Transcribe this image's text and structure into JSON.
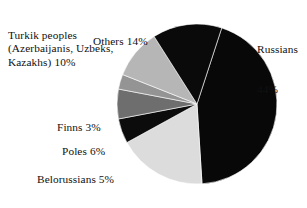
{
  "chart_data": {
    "type": "pie",
    "title": "",
    "subtitle": "",
    "xlabel": "",
    "ylabel": "",
    "legend_position": "none",
    "grid": false,
    "units": "percent",
    "total": 100,
    "categories": [
      "Russians",
      "Ukranians",
      "Belorussians",
      "Poles",
      "Finns",
      "Turkik peoples (Azerbaijanis, Uzbeks, Kazakhs)",
      "Others"
    ],
    "values": [
      44,
      18,
      5,
      6,
      3,
      10,
      14
    ],
    "slices": [
      {
        "name": "Russians",
        "value": 44,
        "value_text": "44%",
        "label_lines": [
          "Russians",
          "44%"
        ],
        "color": "#080808",
        "start_angle": -72.0,
        "end_angle": 86.4
      },
      {
        "name": "Ukranians",
        "value": 18,
        "value_text": "18%",
        "label_lines": [
          "Ukranians 18%"
        ],
        "color": "#dcdcdc",
        "start_angle": 86.4,
        "end_angle": 151.2
      },
      {
        "name": "Belorussians",
        "value": 5,
        "value_text": "5%",
        "label_lines": [
          "Belorussians 5%"
        ],
        "color": "#0c0c0c",
        "start_angle": 151.2,
        "end_angle": 169.2
      },
      {
        "name": "Poles",
        "value": 6,
        "value_text": "6%",
        "label_lines": [
          "Poles 6%"
        ],
        "color": "#6e6e6e",
        "start_angle": 169.2,
        "end_angle": 190.8
      },
      {
        "name": "Finns",
        "value": 3,
        "value_text": "3%",
        "label_lines": [
          "Finns 3%"
        ],
        "color": "#949494",
        "start_angle": 190.8,
        "end_angle": 201.6
      },
      {
        "name": "Turkik peoples",
        "value": 10,
        "value_text": "10%",
        "label_lines": [
          "Turkik peoples",
          "(Azerbaijanis, Uzbeks,",
          "Kazakhs) 10%"
        ],
        "color": "#b6b6b6",
        "start_angle": 201.6,
        "end_angle": 237.6
      },
      {
        "name": "Others",
        "value": 14,
        "value_text": "14%",
        "label_lines": [
          "Others 14%"
        ],
        "color": "#0a0a0a",
        "start_angle": 237.6,
        "end_angle": 288.0
      }
    ],
    "geometry": {
      "center_x": 197,
      "center_y": 104,
      "radius": 80
    }
  },
  "labels": {
    "others": "Others 14%",
    "russians_line1": "Russians",
    "russians_line2": "44%",
    "turkik_line1": "Turkik peoples",
    "turkik_line2": "(Azerbaijanis, Uzbeks,",
    "turkik_line3": "Kazakhs) 10%",
    "finns": "Finns 3%",
    "poles": "Poles 6%",
    "belorussians": "Belorussians 5%",
    "ukranians": "Ukranians 18%"
  }
}
